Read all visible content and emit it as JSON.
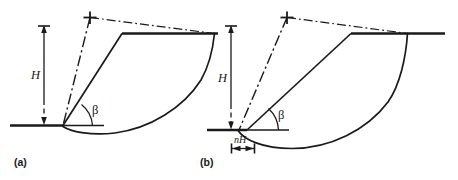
{
  "figure": {
    "type": "engineering-diagram",
    "background_color": "#ffffff",
    "line_color": "#1a1a1a"
  },
  "panels": [
    {
      "id": "a",
      "caption": "(a)",
      "labels": {
        "height": "H",
        "angle": "β"
      },
      "annotations": {
        "height_label": "H",
        "slope_angle_label": "β"
      }
    },
    {
      "id": "b",
      "caption": "(b)",
      "labels": {
        "height": "H",
        "angle": "β",
        "depth_offset": "nH"
      },
      "annotations": {
        "height_label": "H",
        "slope_angle_label": "β",
        "base_offset_label": "nH"
      }
    }
  ],
  "icons": {
    "center_of_rotation": "plus-cross-icon",
    "dimension_arrow": "dimension-arrow-icon"
  }
}
